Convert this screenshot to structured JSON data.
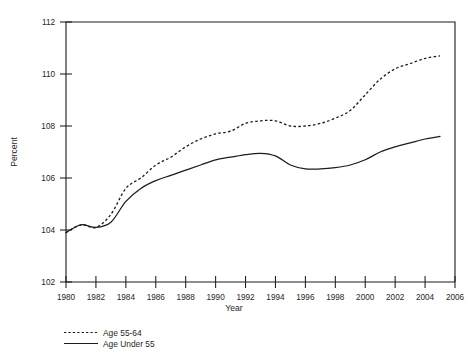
{
  "chart_data": {
    "type": "line",
    "title": "",
    "xlabel": "Year",
    "ylabel": "Percent",
    "xlim": [
      1980,
      2006
    ],
    "ylim": [
      102,
      112
    ],
    "xticks": [
      1980,
      1982,
      1984,
      1986,
      1988,
      1990,
      1992,
      1994,
      1996,
      1998,
      2000,
      2002,
      2004,
      2006
    ],
    "yticks": [
      102,
      104,
      106,
      108,
      110,
      112
    ],
    "grid": false,
    "legend_position": "below-left",
    "x": [
      1980,
      1981,
      1982,
      1983,
      1984,
      1985,
      1986,
      1987,
      1988,
      1989,
      1990,
      1991,
      1992,
      1993,
      1994,
      1995,
      1996,
      1997,
      1998,
      1999,
      2000,
      2001,
      2002,
      2003,
      2004,
      2005
    ],
    "series": [
      {
        "name": "Age 55-64",
        "style": "dotted",
        "color": "#1c1c1c",
        "values": [
          103.9,
          104.2,
          104.1,
          104.6,
          105.6,
          106.0,
          106.5,
          106.8,
          107.2,
          107.5,
          107.7,
          107.8,
          108.1,
          108.2,
          108.2,
          108.0,
          108.0,
          108.1,
          108.3,
          108.6,
          109.2,
          109.8,
          110.2,
          110.4,
          110.6,
          110.7
        ]
      },
      {
        "name": "Age Under 55",
        "style": "solid",
        "color": "#1c1c1c",
        "values": [
          103.9,
          104.2,
          104.1,
          104.3,
          105.1,
          105.6,
          105.9,
          106.1,
          106.3,
          106.5,
          106.7,
          106.8,
          106.9,
          106.95,
          106.85,
          106.5,
          106.35,
          106.35,
          106.4,
          106.5,
          106.7,
          107.0,
          107.2,
          107.35,
          107.5,
          107.6
        ]
      }
    ]
  },
  "legend": {
    "items": [
      {
        "label": "Age 55-64",
        "style": "dotted"
      },
      {
        "label": "Age Under 55",
        "style": "solid"
      }
    ]
  },
  "axis_titles": {
    "x": "Year",
    "y": "Percent"
  }
}
